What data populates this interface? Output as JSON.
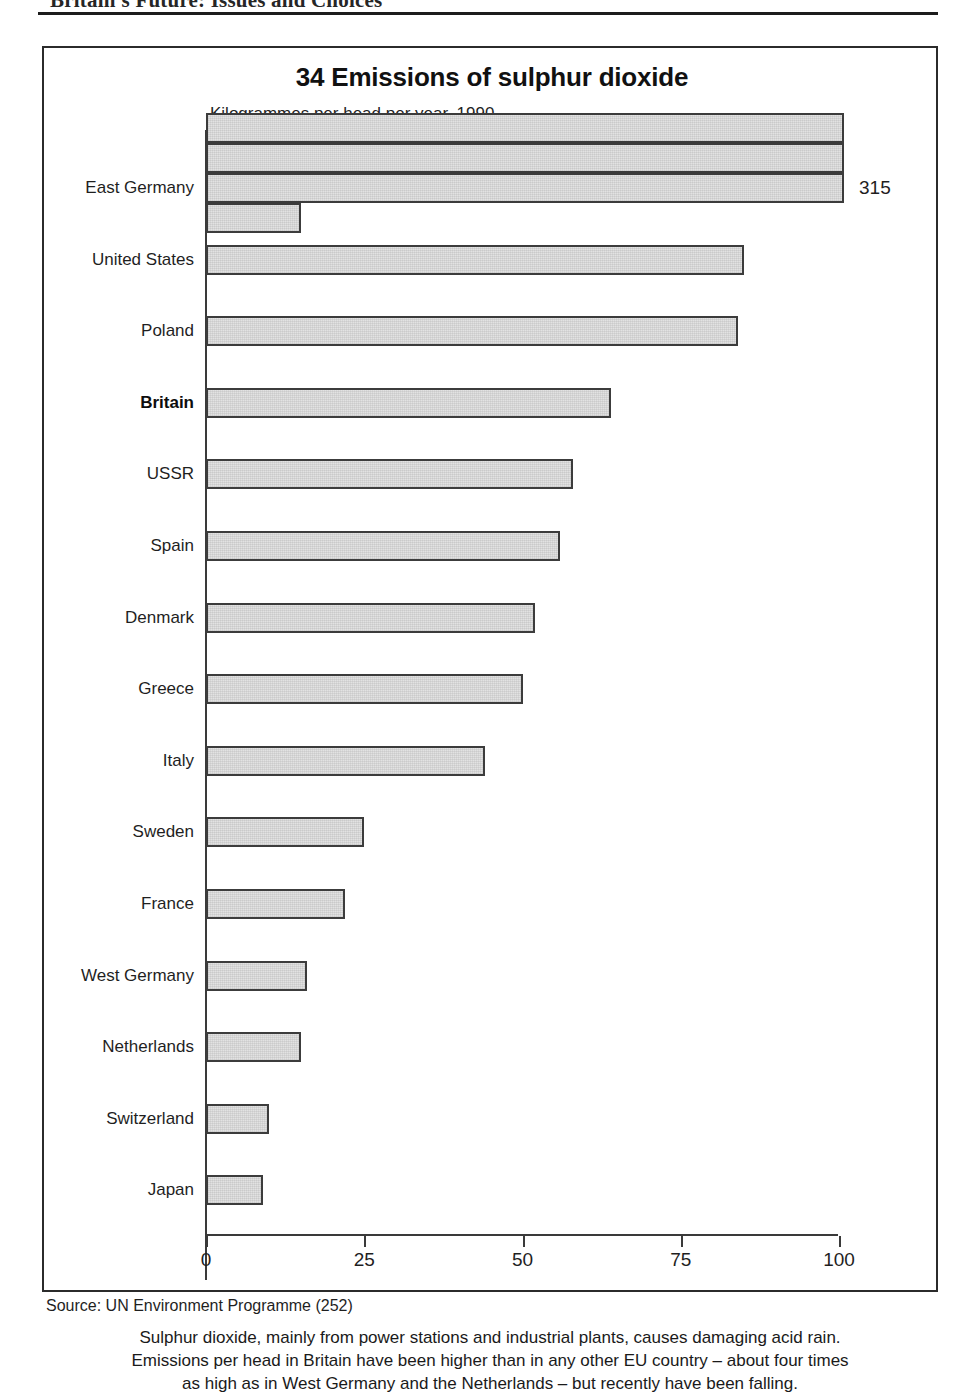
{
  "page": {
    "running_header": "Britain's Future: Issues and Choices"
  },
  "figure": {
    "title": "34 Emissions of sulphur dioxide",
    "subtitle": "Kilogrammes per head per year, 1990",
    "overflow_value_label": "315",
    "source": "Source: UN Environment Programme (252)",
    "caption_line_1": "Sulphur dioxide, mainly from power stations and industrial plants, causes damaging acid rain.",
    "caption_line_2": "Emissions per head in Britain have been higher than in any other EU country – about four times",
    "caption_line_3": "as high as in West Germany and the Netherlands – but recently have been falling."
  },
  "chart_data": {
    "type": "bar",
    "orientation": "horizontal",
    "title": "34 Emissions of sulphur dioxide",
    "subtitle": "Kilogrammes per head per year, 1990",
    "xlabel": "",
    "ylabel": "",
    "xlim": [
      0,
      100
    ],
    "xticks": [
      0,
      25,
      50,
      75,
      100
    ],
    "xtick_labels": [
      "0",
      "25",
      "50",
      "75",
      "100"
    ],
    "grid": false,
    "legend": null,
    "units": "kilogrammes per head per year",
    "year": 1990,
    "categories": [
      "East Germany",
      "United States",
      "Poland",
      "Britain",
      "USSR",
      "Spain",
      "Denmark",
      "Greece",
      "Italy",
      "Sweden",
      "France",
      "West Germany",
      "Netherlands",
      "Switzerland",
      "Japan"
    ],
    "values": [
      315,
      85,
      84,
      64,
      58,
      56,
      52,
      50,
      44,
      25,
      22,
      16,
      15,
      10,
      9
    ],
    "highlighted_category": "Britain",
    "overflow": {
      "category": "East Germany",
      "value": 315,
      "data_label": "315",
      "note": "bar exceeds axis maximum and is drawn wrapped over three and a bit rows"
    },
    "source": "UN Environment Programme (252)",
    "annotations": [
      "Sulphur dioxide, mainly from power stations and industrial plants, causes damaging acid rain.",
      "Emissions per head in Britain have been higher than in any other EU country – about four times as high as in West Germany and the Netherlands – but recently have been falling."
    ]
  }
}
